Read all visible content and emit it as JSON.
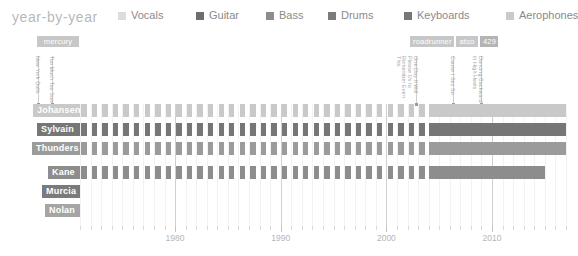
{
  "header": {
    "title": "year-by-year",
    "legend": [
      {
        "label": "Vocals",
        "color": "#dcdcdc",
        "x": 0
      },
      {
        "label": "Guitar",
        "color": "#6e6e6e",
        "x": 78
      },
      {
        "label": "Bass",
        "color": "#8d8d8d",
        "x": 148
      },
      {
        "label": "Drums",
        "color": "#7b7b7b",
        "x": 210
      },
      {
        "label": "Keyboards",
        "color": "#777777",
        "x": 286
      },
      {
        "label": "Aerophones",
        "color": "#c9c9c9",
        "x": 388
      }
    ]
  },
  "labels_chips": [
    {
      "name": "mercury",
      "x": 37,
      "y": 36,
      "w": 42,
      "color": "#c7c7c7"
    },
    {
      "name": "roadrunner",
      "x": 410,
      "y": 36,
      "w": 44,
      "color": "#c7c7c7"
    },
    {
      "name": "atco",
      "x": 456,
      "y": 36,
      "w": 22,
      "color": "#c7c7c7"
    },
    {
      "name": "429",
      "x": 480,
      "y": 36,
      "w": 18,
      "color": "#b4b4b4"
    }
  ],
  "albums": [
    {
      "title": "New York Dolls",
      "x": 38,
      "top": 56,
      "height": 48
    },
    {
      "title": "Too Much Too Soon",
      "x": 52,
      "top": 56,
      "height": 48
    },
    {
      "title": "One Day It Will Please Us to Remember Even This",
      "x": 416,
      "top": 56,
      "height": 48
    },
    {
      "title": "Cause I Sez So",
      "x": 453,
      "top": 56,
      "height": 48
    },
    {
      "title": "Dancing Backward in High Heels",
      "x": 481,
      "top": 56,
      "height": 48
    }
  ],
  "chart_data": {
    "type": "timeline",
    "title": "year-by-year",
    "xlabel": "",
    "ylabel": "",
    "xlim": [
      1971,
      2017
    ],
    "tick_labels": [
      "1980",
      "1990",
      "2000",
      "2010"
    ],
    "tick_years": [
      1980,
      1990,
      2000,
      2010
    ],
    "grid": true,
    "legend_position": "top",
    "members": [
      {
        "name": "Johansen",
        "name_w": 47,
        "row_y": 0,
        "row_h": 13,
        "color": "#c9c9c9"
      },
      {
        "name": "Sylvain",
        "name_w": 43,
        "row_y": 19,
        "row_h": 13,
        "color": "#767676"
      },
      {
        "name": "Thunders",
        "name_w": 48,
        "row_y": 38,
        "row_h": 13,
        "color": "#9b9b9b"
      },
      {
        "name": "Kane",
        "name_w": 32,
        "row_y": 62,
        "row_h": 13,
        "color": "#8d8d8d"
      },
      {
        "name": "Murcia",
        "name_w": 38,
        "row_y": 81,
        "row_h": 13,
        "color": "#7b7b7b"
      },
      {
        "name": "Nolan",
        "name_w": 35,
        "row_y": 100,
        "row_h": 13,
        "color": "#a5a5a5"
      }
    ],
    "series": [
      {
        "name": "Johansen",
        "instrument": "Vocals",
        "color": "#c9c9c9",
        "row": 0,
        "mode": "yearly",
        "years_active": [
          1971,
          1972,
          1973,
          1974,
          1975,
          1976,
          1977,
          1978,
          1979,
          1980,
          1981,
          1982,
          1983,
          1984,
          1985,
          1986,
          1987,
          1988,
          1989,
          1990,
          1991,
          1992,
          1993,
          1994,
          1995,
          1996,
          1997,
          1998,
          1999,
          2000,
          2001,
          2002,
          2003
        ],
        "solid_span": [
          2004,
          2017
        ]
      },
      {
        "name": "Sylvain",
        "instrument": "Guitar",
        "color": "#767676",
        "row": 1,
        "mode": "yearly",
        "years_active": [
          1971,
          1972,
          1973,
          1974,
          1975,
          1976,
          1977,
          1978,
          1979,
          1980,
          1981,
          1982,
          1983,
          1984,
          1985,
          1986,
          1987,
          1988,
          1989,
          1990,
          1991,
          1992,
          1993,
          1994,
          1995,
          1996,
          1997,
          1998,
          1999,
          2000,
          2001,
          2002,
          2003
        ],
        "solid_span": [
          2004,
          2017
        ]
      },
      {
        "name": "Thunders",
        "instrument": "Guitar",
        "color": "#9b9b9b",
        "row": 2,
        "mode": "yearly",
        "years_active": [
          1971,
          1972,
          1973,
          1974,
          1975,
          1976,
          1977,
          1978,
          1979,
          1980,
          1981,
          1982,
          1983,
          1984,
          1985,
          1986,
          1987,
          1988,
          1989,
          1990,
          1991,
          1992,
          1993,
          1994,
          1995,
          1996,
          1997,
          1998,
          1999,
          2000,
          2001,
          2002,
          2003
        ],
        "solid_span": [
          2004,
          2017
        ]
      },
      {
        "name": "Kane",
        "instrument": "Bass",
        "color": "#8d8d8d",
        "row": 3,
        "mode": "yearly",
        "years_active": [
          1971,
          1972,
          1973,
          1974,
          1975,
          1976,
          1977,
          1978,
          1979,
          1980,
          1981,
          1982,
          1983,
          1984,
          1985,
          1986,
          1987,
          1988,
          1989,
          1990,
          1991,
          1992,
          1993,
          1994,
          1995,
          1996,
          1997,
          1998,
          1999,
          2000,
          2001,
          2002,
          2003
        ],
        "solid_span": [
          2004,
          2015
        ]
      },
      {
        "name": "Murcia",
        "instrument": "Drums",
        "color": "#7b7b7b",
        "row": 4,
        "mode": "none",
        "years_active": [],
        "solid_span": null
      },
      {
        "name": "Nolan",
        "instrument": "Drums",
        "color": "#a5a5a5",
        "row": 5,
        "mode": "none",
        "years_active": [],
        "solid_span": null
      }
    ]
  }
}
